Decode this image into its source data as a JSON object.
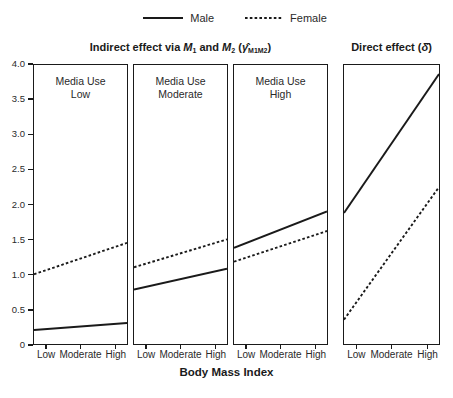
{
  "colors": {
    "ink": "#1a1a1a",
    "background": "#ffffff"
  },
  "titles": {
    "indirect": {
      "pre": "Indirect effect via ",
      "m1": "M",
      "m1_sub": "1",
      "conj": " and ",
      "m2": "M",
      "m2_sub": "2",
      "sym_open": " (",
      "symbol": "γ̂",
      "symbol_sub": "M1M2",
      "sym_close": ")"
    },
    "direct": {
      "pre": "Direct effect ",
      "sym_open": "(",
      "symbol": "δ̂",
      "sym_close": ")"
    }
  },
  "chart_data": {
    "type": "line",
    "categories": [
      "Low",
      "Moderate",
      "High"
    ],
    "xlabel": "Body Mass Index",
    "ylim": [
      0,
      4
    ],
    "yticks": [
      {
        "value": 0,
        "label": "0"
      },
      {
        "value": 0.5,
        "label": "0.5"
      },
      {
        "value": 1,
        "label": "1.0"
      },
      {
        "value": 1.5,
        "label": "1.5"
      },
      {
        "value": 2,
        "label": "2.0"
      },
      {
        "value": 2.5,
        "label": "2.5"
      },
      {
        "value": 3,
        "label": "3.0"
      },
      {
        "value": 3.5,
        "label": "3.5"
      },
      {
        "value": 4,
        "label": "4.0"
      }
    ],
    "legend": [
      {
        "name": "Male",
        "style": "solid"
      },
      {
        "name": "Female",
        "style": "dotted"
      }
    ],
    "legend_position": "top-center",
    "grid": false,
    "panels": [
      {
        "label_lines": [
          "Media Use",
          "Low"
        ],
        "series": [
          {
            "name": "Male",
            "style": "solid",
            "edge_start": 0.2,
            "edge_end": 0.3,
            "values": [
              0.21,
              0.25,
              0.29
            ]
          },
          {
            "name": "Female",
            "style": "dotted",
            "edge_start": 1.0,
            "edge_end": 1.45,
            "values": [
              1.05,
              1.22,
              1.4
            ]
          }
        ]
      },
      {
        "label_lines": [
          "Media Use",
          "Moderate"
        ],
        "series": [
          {
            "name": "Male",
            "style": "solid",
            "edge_start": 0.78,
            "edge_end": 1.08,
            "values": [
              0.82,
              0.93,
              1.04
            ]
          },
          {
            "name": "Female",
            "style": "dotted",
            "edge_start": 1.1,
            "edge_end": 1.5,
            "values": [
              1.15,
              1.3,
              1.45
            ]
          }
        ]
      },
      {
        "label_lines": [
          "Media Use",
          "High"
        ],
        "series": [
          {
            "name": "Male",
            "style": "solid",
            "edge_start": 1.38,
            "edge_end": 1.9,
            "values": [
              1.45,
              1.64,
              1.84
            ]
          },
          {
            "name": "Female",
            "style": "dotted",
            "edge_start": 1.18,
            "edge_end": 1.62,
            "values": [
              1.24,
              1.4,
              1.56
            ]
          }
        ]
      },
      {
        "label_lines": [],
        "series": [
          {
            "name": "Male",
            "style": "solid",
            "edge_start": 1.88,
            "edge_end": 3.87,
            "values": [
              2.13,
              2.88,
              3.62
            ]
          },
          {
            "name": "Female",
            "style": "dotted",
            "edge_start": 0.35,
            "edge_end": 2.25,
            "values": [
              0.59,
              1.3,
              2.01
            ]
          }
        ]
      }
    ]
  }
}
